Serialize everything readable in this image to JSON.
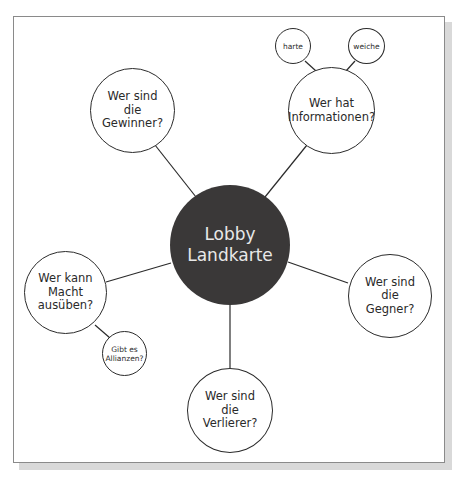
{
  "diagram": {
    "title": "Lobby Landkarte",
    "center": {
      "label": "Lobby\nLandkarte",
      "fill": "#3a3838",
      "text_color": "#e8e8e8"
    },
    "nodes": [
      {
        "id": "gewinner",
        "label": "Wer sind\ndie\nGewinner?"
      },
      {
        "id": "informationen",
        "label": "Wer hat\nInformationen?"
      },
      {
        "id": "harte",
        "label": "harte",
        "parent": "informationen"
      },
      {
        "id": "weiche",
        "label": "weiche",
        "parent": "informationen"
      },
      {
        "id": "macht",
        "label": "Wer kann\nMacht\nausüben?"
      },
      {
        "id": "allianzen",
        "label": "Gibt es\nAllianzen?",
        "parent": "macht"
      },
      {
        "id": "gegner",
        "label": "Wer sind\ndie\nGegner?"
      },
      {
        "id": "verlierer",
        "label": "Wer sind\ndie\nVerlierer?"
      }
    ],
    "edges": [
      [
        "center",
        "gewinner"
      ],
      [
        "center",
        "informationen"
      ],
      [
        "center",
        "macht"
      ],
      [
        "center",
        "gegner"
      ],
      [
        "center",
        "verlierer"
      ],
      [
        "informationen",
        "harte"
      ],
      [
        "informationen",
        "weiche"
      ],
      [
        "macht",
        "allianzen"
      ]
    ]
  }
}
